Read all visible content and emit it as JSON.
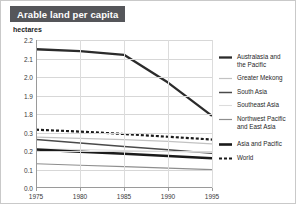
{
  "title": "Arable land per capita",
  "unit_label": "hectares",
  "chart_data": {
    "type": "line",
    "title": "Arable land per capita",
    "xlabel": "",
    "ylabel": "hectares",
    "x": [
      1975,
      1980,
      1985,
      1990,
      1995
    ],
    "xlim": [
      1975,
      1995
    ],
    "xticks": [
      "1975",
      "1980",
      "1985",
      "1990",
      "1995"
    ],
    "yticks": [
      "2.2",
      "2.1",
      "2.0",
      "1.9",
      "1.8",
      "0.3",
      "0.2",
      "0.1",
      "0.0"
    ],
    "y_axis_break": true,
    "y_upper_range": [
      1.8,
      2.2
    ],
    "y_lower_range": [
      0.0,
      0.3
    ],
    "grid": true,
    "legend_position": "right",
    "series": [
      {
        "name": "Australasia and\nthe Pacific",
        "color": "#2b2b2b",
        "width": 2.3,
        "dash": "none",
        "values": [
          2.15,
          2.14,
          2.12,
          1.97,
          1.79
        ]
      },
      {
        "name": "Greater Mekong",
        "color": "#c2c2c2",
        "width": 1.2,
        "dash": "none",
        "values": [
          0.275,
          0.268,
          0.262,
          0.252,
          0.238
        ]
      },
      {
        "name": "South Asia",
        "color": "#4a4a4a",
        "width": 1.5,
        "dash": "none",
        "values": [
          0.262,
          0.243,
          0.225,
          0.207,
          0.188
        ]
      },
      {
        "name": "Southeast Asia",
        "color": "#dcdcdc",
        "width": 1.1,
        "dash": "none",
        "values": [
          0.212,
          0.208,
          0.203,
          0.197,
          0.192
        ]
      },
      {
        "name": "Northwest Pacific\nand East Asia",
        "color": "#8e8e8e",
        "width": 1.2,
        "dash": "none",
        "values": [
          0.131,
          0.123,
          0.115,
          0.107,
          0.099
        ]
      },
      {
        "name": "Asia and Pacific",
        "color": "#1a1a1a",
        "width": 2.6,
        "dash": "none",
        "values": [
          0.208,
          0.196,
          0.185,
          0.173,
          0.161
        ]
      },
      {
        "name": "World",
        "color": "#1a1a1a",
        "width": 2.2,
        "dash": "3,2",
        "values": [
          0.315,
          0.305,
          0.292,
          0.277,
          0.262
        ]
      }
    ]
  }
}
